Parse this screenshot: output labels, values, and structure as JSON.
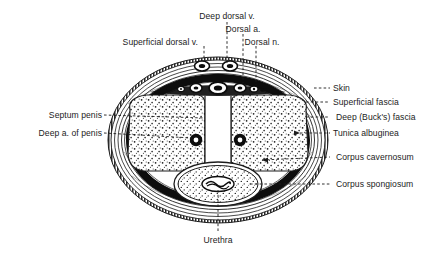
{
  "figure": {
    "background_color": "#ffffff",
    "ink_color": "#1c1c1c",
    "leader_style": "dashed"
  },
  "labels": {
    "deep_dorsal_vein": "Deep dorsal v.",
    "dorsal_artery": "Dorsal a.",
    "dorsal_nerve": "Dorsal n.",
    "superficial_dorsal_vein": "Superficial dorsal v.",
    "skin": "Skin",
    "superficial_fascia": "Superficial fascia",
    "deep_bucks_fascia": "Deep (Buck's) fascia",
    "tunica_albuginea": "Tunica albuginea",
    "corpus_cavernosum": "Corpus cavernosum",
    "corpus_spongiosum": "Corpus spongiosum",
    "septum_penis": "Septum penis",
    "deep_artery_of_penis": "Deep a. of penis",
    "urethra": "Urethra"
  },
  "structures": {
    "outer_skin_ring": "hatched-outer-border",
    "superficial_fascia_layer": "thin-line-layer",
    "deep_fascia_layer": "thin-line-layer",
    "tunica_albuginea_ring": "thick-black-ring",
    "corpora_cavernosa_count": 2,
    "corpus_spongiosum_count": 1,
    "dorsal_vessel_cluster": "midline-dorsal-neurovascular-bundle",
    "stipple_fill": "dotted-erectile-tissue"
  }
}
